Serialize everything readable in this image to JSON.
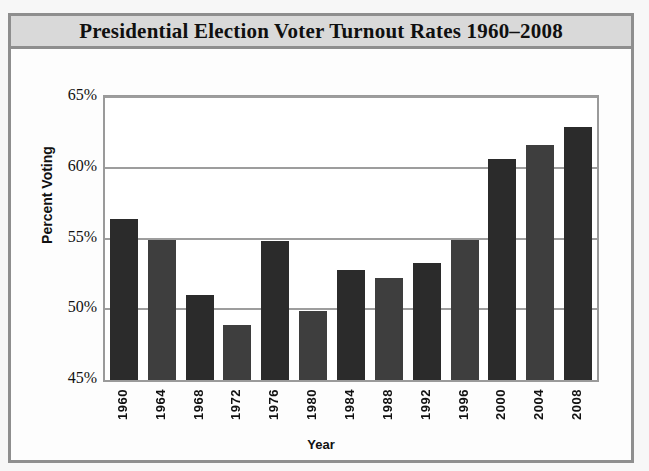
{
  "figure": {
    "title": "Presidential Election Voter Turnout Rates 1960–2008"
  },
  "chart_data": {
    "type": "bar",
    "title": "Presidential Election Voter Turnout Rates 1960–2008",
    "xlabel": "Year",
    "ylabel": "Percent Voting",
    "categories": [
      "1960",
      "1964",
      "1968",
      "1972",
      "1976",
      "1980",
      "1984",
      "1988",
      "1992",
      "1996",
      "2000",
      "2004",
      "2008"
    ],
    "values": [
      56.4,
      54.9,
      51.0,
      48.9,
      54.8,
      49.9,
      52.8,
      52.2,
      53.3,
      54.9,
      60.6,
      61.6,
      62.9
    ],
    "ylim": [
      45,
      65
    ],
    "yticks": [
      45,
      50,
      55,
      60,
      65
    ],
    "ytick_labels": [
      "45%",
      "50%",
      "55%",
      "60%",
      "65%"
    ],
    "grid": true,
    "legend": "none",
    "bar_colors": [
      "#2b2b2b",
      "#3e3e3e"
    ],
    "series": [
      {
        "name": "Voter Turnout",
        "values": [
          56.4,
          54.9,
          51.0,
          48.9,
          54.8,
          49.9,
          52.8,
          52.2,
          53.3,
          54.9,
          60.6,
          61.6,
          62.9
        ]
      }
    ]
  },
  "colors": {
    "frame": "#8e8e8e",
    "title_band": "#d9d9d9",
    "gridline": "#9d9d9d",
    "text": "#101010"
  }
}
